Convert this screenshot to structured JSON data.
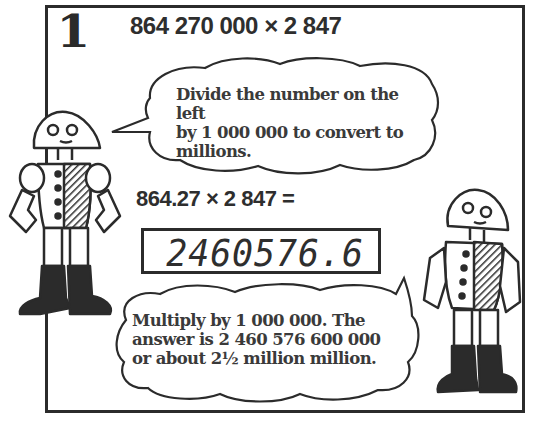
{
  "panel": {
    "step_number": "1",
    "problem": "864 270 000 × 2 847",
    "bubble_top": {
      "lines": [
        "Divide the number on the left",
        "by 1 000 000 to convert to",
        "millions."
      ]
    },
    "equation": "864.27 × 2 847 =",
    "calculator_display": "2460576.6",
    "bubble_bottom": {
      "lines": [
        "Multiply by 1 000 000. The",
        "answer is 2 460 576 600 000",
        "or about 2½ million million."
      ]
    }
  },
  "colors": {
    "ink": "#2b2b2b",
    "paper": "#ffffff"
  },
  "icons": {
    "left_robot": "robot-character-icon",
    "right_robot": "robot-character-icon"
  }
}
